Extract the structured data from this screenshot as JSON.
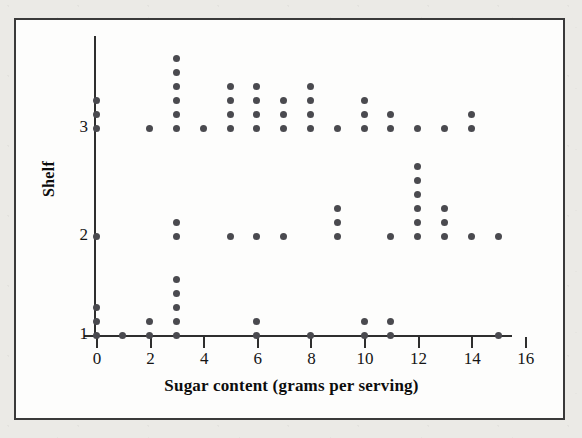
{
  "figure": {
    "x_axis_title": "Sugar content (grams per serving)",
    "y_axis_title": "Shelf",
    "x_tick_labels": [
      "0",
      "2",
      "4",
      "6",
      "8",
      "10",
      "12",
      "14",
      "16"
    ],
    "y_tick_labels": [
      "1",
      "2",
      "3"
    ],
    "dot_color": "#4a4a4f",
    "axis_color": "#2e2e2e",
    "frame_color": "#3a3a3a",
    "page_background": "#ebeae6",
    "plot_background": "#fdfdfc"
  },
  "chart_data": {
    "type": "scatter",
    "title": "",
    "xlabel": "Sugar content (grams per serving)",
    "ylabel": "Shelf",
    "xlim": [
      -0.6,
      16.6
    ],
    "ylim": [
      0.72,
      3.6
    ],
    "xticks": [
      0,
      2,
      4,
      6,
      8,
      10,
      12,
      14,
      16
    ],
    "yticks": [
      1,
      2,
      3
    ],
    "grid": false,
    "legend": "none",
    "series": [
      {
        "name": "Shelf 1",
        "shelf": 1,
        "counts": {
          "0": 3,
          "1": 1,
          "2": 2,
          "3": 5,
          "6": 2,
          "8": 1,
          "10": 2,
          "11": 2,
          "15": 1
        },
        "total": 19
      },
      {
        "name": "Shelf 2",
        "shelf": 2,
        "counts": {
          "0": 1,
          "3": 2,
          "5": 1,
          "6": 1,
          "7": 1,
          "9": 3,
          "11": 1,
          "12": 6,
          "13": 3,
          "14": 1,
          "15": 1
        },
        "total": 21
      },
      {
        "name": "Shelf 3",
        "shelf": 3,
        "counts": {
          "0": 3,
          "2": 1,
          "3": 6,
          "4": 1,
          "5": 4,
          "6": 4,
          "7": 3,
          "8": 4,
          "9": 1,
          "10": 3,
          "11": 2,
          "12": 1,
          "13": 1,
          "14": 2
        },
        "total": 36
      }
    ]
  }
}
